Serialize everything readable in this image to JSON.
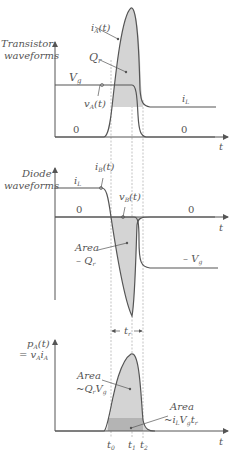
{
  "colors": {
    "line": "#555555",
    "guide": "#aaaaaa",
    "fill_light": "#d4d4d4",
    "fill_dark": "#b4b4b4",
    "text": "#555555"
  },
  "transistor": {
    "axis_label_1": "Transistor",
    "axis_label_2": "waveforms",
    "curve_ia": "i",
    "curve_ia_sub": "A",
    "curve_ia_arg": "(t)",
    "charge": "Q",
    "charge_sub": "r",
    "vg": "V",
    "vg_sub": "g",
    "curve_va": "v",
    "curve_va_sub": "A",
    "curve_va_arg": "(t)",
    "il": "i",
    "il_sub": "L",
    "zero_left": "0",
    "zero_right": "0",
    "t_axis": "t"
  },
  "diode": {
    "axis_label_1": "Diode",
    "axis_label_2": "waveforms",
    "curve_ib": "i",
    "curve_ib_sub": "B",
    "curve_ib_arg": "(t)",
    "il": "i",
    "il_sub": "L",
    "curve_vb": "v",
    "curve_vb_sub": "B",
    "curve_vb_arg": "(t)",
    "zero_left": "0",
    "zero_right": "0",
    "t_axis": "t",
    "area_label": "Area",
    "area_value": "– Q",
    "area_value_sub": "r",
    "neg_vg": "– V",
    "neg_vg_sub": "g"
  },
  "rise_time": {
    "label": "t",
    "label_sub": "r"
  },
  "power": {
    "axis_label_1": "p",
    "axis_label_1_sub": "A",
    "axis_label_1_arg": "(t)",
    "axis_label_2": "= v",
    "axis_label_2_sub1": "A",
    "axis_label_2_i": "i",
    "axis_label_2_sub2": "A",
    "area1_label": "Area",
    "area1_value": "~Q",
    "area1_value_sub1": "r",
    "area1_value_v": "V",
    "area1_value_sub2": "g",
    "area2_label": "Area",
    "area2_value": "~i",
    "area2_value_sub1": "L",
    "area2_value_v": "V",
    "area2_value_sub2": "g",
    "area2_value_t": "t",
    "area2_value_sub3": "r",
    "t_axis": "t",
    "t0": "t",
    "t0_sub": "0",
    "t1": "t",
    "t1_sub": "1",
    "t2": "t",
    "t2_sub": "2"
  }
}
